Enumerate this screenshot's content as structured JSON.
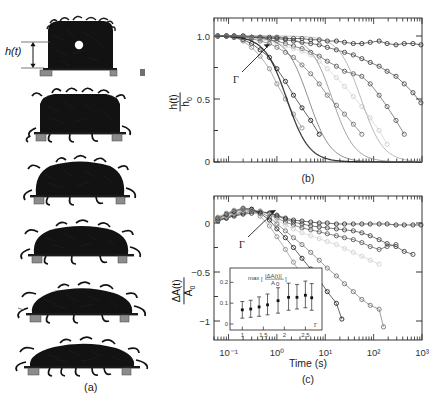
{
  "figure": {
    "panels": [
      {
        "tag": "(a)",
        "kind": "photo-series",
        "caption_label": "(a)"
      },
      {
        "tag": "(b)",
        "kind": "plot",
        "caption_label": "(b)"
      },
      {
        "tag": "(c)",
        "kind": "plot",
        "caption_label": "(c)"
      }
    ]
  },
  "panel_a": {
    "label": "(a)",
    "height_annotation": "h(t)",
    "frame_count": 6,
    "description_alt": "time series photographs of an ant aggregate spreading and flattening on a plate"
  },
  "axis_labels": {
    "y_b_num": "h(t)",
    "y_b_den": "h",
    "y_b_den_sub": "0",
    "y_c_num": "ΔA(t)",
    "y_c_den": "A",
    "y_c_den_sub": "0",
    "x_time": "Time (s)",
    "gamma": "Γ"
  },
  "chart_data": [
    {
      "type": "line",
      "panel": "(b)",
      "title": "",
      "xlabel": "Time (s)",
      "ylabel": "h(t)/h0",
      "xscale": "log",
      "xlim": [
        0.05,
        1000
      ],
      "ylim": [
        0,
        1.12
      ],
      "yticks": [
        0,
        0.5,
        1.0
      ],
      "ytick_labels": [
        "0",
        "0.5",
        "1.0"
      ],
      "xticks": [
        0.1,
        1,
        10,
        100,
        1000
      ],
      "xtick_labels": [
        "",
        "",
        "",
        "",
        ""
      ],
      "grid": false,
      "legend": "none",
      "annotations": [
        {
          "text": "Γ",
          "x": 0.45,
          "y": 0.62,
          "arrow_to_x": 2.2,
          "arrow_to_y": 0.99
        }
      ],
      "series": [
        {
          "name": "G1",
          "shade": "#2b2b2b",
          "marker": "open-circle",
          "x": [
            0.06,
            0.09,
            0.13,
            0.2,
            0.3,
            0.45,
            0.7,
            1.0,
            1.5,
            2.2,
            3.3,
            5,
            7.5,
            11,
            17,
            25,
            38,
            57,
            85,
            130,
            190,
            290,
            430,
            650,
            950
          ],
          "y": [
            1.0,
            1.0,
            1.0,
            1.0,
            0.99,
            0.99,
            0.99,
            0.99,
            0.98,
            0.98,
            0.98,
            0.97,
            0.97,
            0.96,
            0.96,
            0.95,
            0.94,
            0.94,
            0.95,
            0.96,
            0.94,
            0.93,
            0.94,
            0.94,
            0.93
          ]
        },
        {
          "name": "G2",
          "shade": "#3d3d3d",
          "marker": "open-circle",
          "x": [
            0.06,
            0.09,
            0.13,
            0.2,
            0.3,
            0.45,
            0.7,
            1.0,
            1.5,
            2.2,
            3.3,
            5,
            7.5,
            11,
            17,
            25,
            38,
            57,
            85,
            130,
            190,
            290,
            430,
            650,
            950
          ],
          "y": [
            1.0,
            1.0,
            1.0,
            1.0,
            0.99,
            0.99,
            0.98,
            0.98,
            0.97,
            0.96,
            0.95,
            0.94,
            0.93,
            0.91,
            0.89,
            0.87,
            0.85,
            0.82,
            0.79,
            0.76,
            0.72,
            0.68,
            0.62,
            0.55,
            0.47
          ]
        },
        {
          "name": "G3",
          "shade": "#555555",
          "marker": "open-circle",
          "x": [
            0.06,
            0.09,
            0.13,
            0.2,
            0.3,
            0.45,
            0.7,
            1.0,
            1.5,
            2.2,
            3.3,
            5,
            7.5,
            11,
            17,
            25,
            38,
            57,
            85,
            130,
            190,
            290,
            430
          ],
          "y": [
            1.0,
            1.0,
            1.0,
            0.99,
            0.99,
            0.98,
            0.97,
            0.96,
            0.94,
            0.92,
            0.9,
            0.87,
            0.84,
            0.8,
            0.76,
            0.72,
            0.7,
            0.68,
            0.62,
            0.53,
            0.44,
            0.33,
            0.22
          ]
        },
        {
          "name": "G4",
          "shade": "#cfcfcf",
          "marker": "open-circle",
          "x": [
            0.06,
            0.09,
            0.13,
            0.2,
            0.3,
            0.45,
            0.7,
            1.0,
            1.5,
            2.2,
            3.3,
            5,
            7.5,
            11,
            17,
            25,
            38,
            57,
            85,
            130,
            190
          ],
          "y": [
            1.0,
            1.0,
            0.99,
            0.99,
            0.98,
            0.97,
            0.96,
            0.94,
            0.92,
            0.9,
            0.88,
            0.85,
            0.8,
            0.74,
            0.67,
            0.6,
            0.52,
            0.44,
            0.35,
            0.25,
            0.14
          ]
        },
        {
          "name": "G5",
          "shade": "#6e6e6e",
          "marker": "open-circle",
          "x": [
            0.06,
            0.09,
            0.13,
            0.2,
            0.3,
            0.45,
            0.7,
            1.0,
            1.5,
            2.2,
            3.3,
            5,
            7.5,
            11,
            17,
            25,
            38,
            57
          ],
          "y": [
            1.0,
            1.0,
            0.99,
            0.99,
            0.98,
            0.96,
            0.94,
            0.91,
            0.87,
            0.83,
            0.77,
            0.7,
            0.62,
            0.53,
            0.45,
            0.38,
            0.3,
            0.22
          ]
        },
        {
          "name": "G6",
          "shade": "#1a1a1a",
          "marker": "open-circle",
          "x": [
            0.06,
            0.09,
            0.13,
            0.2,
            0.3,
            0.45,
            0.7,
            1.0,
            1.5,
            2.2,
            3.3,
            5,
            7.5
          ],
          "y": [
            1.0,
            1.0,
            0.99,
            0.97,
            0.94,
            0.89,
            0.83,
            0.74,
            0.64,
            0.53,
            0.43,
            0.33,
            0.22
          ]
        },
        {
          "name": "G7",
          "shade": "#8a8a8a",
          "marker": "open-circle",
          "x": [
            0.06,
            0.09,
            0.13,
            0.2,
            0.3,
            0.45,
            0.7,
            1.0,
            1.5,
            2.2,
            3.3
          ],
          "y": [
            1.0,
            1.0,
            0.99,
            0.96,
            0.91,
            0.84,
            0.74,
            0.62,
            0.5,
            0.38,
            0.27
          ]
        }
      ],
      "fit_curves": [
        {
          "name": "fit1",
          "shade": "#1a1a1a"
        },
        {
          "name": "fit2",
          "shade": "#444444"
        },
        {
          "name": "fit3",
          "shade": "#666666"
        },
        {
          "name": "fit4",
          "shade": "#888888"
        }
      ]
    },
    {
      "type": "line",
      "panel": "(c)",
      "title": "",
      "xlabel": "Time (s)",
      "ylabel": "ΔA(t)/A0",
      "xscale": "log",
      "xlim": [
        0.05,
        1000
      ],
      "ylim": [
        -1.18,
        0.28
      ],
      "yticks": [
        0,
        -0.5,
        -1
      ],
      "ytick_labels": [
        "0",
        "−0.5",
        "−1"
      ],
      "xticks": [
        0.1,
        1,
        10,
        100,
        1000
      ],
      "xtick_labels": [
        "10⁻¹",
        "10⁰",
        "10¹",
        "10²",
        "10³"
      ],
      "grid": false,
      "legend": "none",
      "annotations": [
        {
          "text": "Γ",
          "x": 0.4,
          "y": -0.24,
          "arrow_to_x": 2.0,
          "arrow_to_y": 0.14
        }
      ],
      "series": [
        {
          "name": "G1",
          "shade": "#2b2b2b",
          "marker": "open-circle",
          "x": [
            0.06,
            0.09,
            0.13,
            0.2,
            0.3,
            0.45,
            0.7,
            1.0,
            1.5,
            2.2,
            3.3,
            5,
            7.5,
            11,
            17,
            25,
            38,
            57,
            85,
            130,
            190,
            290,
            430,
            650,
            950
          ],
          "y": [
            0.03,
            0.05,
            0.07,
            0.09,
            0.1,
            0.11,
            0.1,
            0.08,
            0.05,
            0.03,
            0.02,
            0.01,
            0.0,
            0.0,
            -0.01,
            -0.01,
            -0.01,
            -0.01,
            -0.01,
            -0.01,
            -0.01,
            -0.02,
            -0.02,
            -0.02,
            -0.02
          ]
        },
        {
          "name": "G2",
          "shade": "#3d3d3d",
          "marker": "open-circle",
          "x": [
            0.06,
            0.09,
            0.13,
            0.2,
            0.3,
            0.45,
            0.7,
            1.0,
            1.5,
            2.2,
            3.3,
            5,
            7.5,
            11,
            17,
            25,
            38,
            57,
            85,
            130,
            190,
            290,
            430,
            650
          ],
          "y": [
            0.02,
            0.05,
            0.08,
            0.1,
            0.12,
            0.12,
            0.1,
            0.07,
            0.04,
            0.01,
            -0.01,
            -0.03,
            -0.04,
            -0.05,
            -0.06,
            -0.07,
            -0.08,
            -0.1,
            -0.13,
            -0.17,
            -0.21,
            -0.24,
            -0.29,
            -0.32
          ]
        },
        {
          "name": "G3",
          "shade": "#555555",
          "marker": "open-circle",
          "x": [
            0.06,
            0.09,
            0.13,
            0.2,
            0.3,
            0.45,
            0.7,
            1.0,
            1.5,
            2.2,
            3.3,
            5,
            7.5,
            11,
            17,
            25,
            38,
            57,
            85,
            130,
            190,
            290
          ],
          "y": [
            0.03,
            0.06,
            0.09,
            0.12,
            0.13,
            0.12,
            0.09,
            0.05,
            0.01,
            -0.02,
            -0.05,
            -0.07,
            -0.09,
            -0.11,
            -0.13,
            -0.15,
            -0.17,
            -0.2,
            -0.24,
            -0.27,
            -0.24,
            -0.22
          ]
        },
        {
          "name": "G4",
          "shade": "#cfcfcf",
          "marker": "open-circle",
          "x": [
            0.06,
            0.09,
            0.13,
            0.2,
            0.3,
            0.45,
            0.7,
            1.0,
            1.5,
            2.2,
            3.3,
            5,
            7.5,
            11,
            17,
            25,
            38,
            57,
            85,
            130
          ],
          "y": [
            0.04,
            0.07,
            0.1,
            0.13,
            0.14,
            0.12,
            0.08,
            0.03,
            -0.02,
            -0.06,
            -0.1,
            -0.13,
            -0.16,
            -0.19,
            -0.22,
            -0.26,
            -0.3,
            -0.34,
            -0.38,
            -0.42
          ]
        },
        {
          "name": "G5",
          "shade": "#6e6e6e",
          "marker": "open-circle",
          "x": [
            0.06,
            0.09,
            0.13,
            0.2,
            0.3,
            0.45,
            0.7,
            1.0,
            1.5,
            2.2,
            3.3,
            5,
            7.5,
            11,
            17,
            25,
            38,
            57,
            85,
            130,
            160
          ],
          "y": [
            0.04,
            0.08,
            0.11,
            0.14,
            0.14,
            0.11,
            0.06,
            -0.01,
            -0.08,
            -0.15,
            -0.22,
            -0.3,
            -0.38,
            -0.46,
            -0.54,
            -0.62,
            -0.7,
            -0.78,
            -0.84,
            -0.88,
            -1.06
          ]
        },
        {
          "name": "G6",
          "shade": "#1a1a1a",
          "marker": "open-circle",
          "x": [
            0.06,
            0.09,
            0.13,
            0.2,
            0.3,
            0.45,
            0.7,
            1.0,
            1.5,
            2.2,
            3.3,
            5,
            7.5,
            11,
            17,
            22
          ],
          "y": [
            0.05,
            0.09,
            0.12,
            0.15,
            0.14,
            0.1,
            0.03,
            -0.06,
            -0.15,
            -0.25,
            -0.36,
            -0.47,
            -0.58,
            -0.7,
            -0.82,
            -0.98
          ]
        },
        {
          "name": "G7",
          "shade": "#8a8a8a",
          "marker": "open-circle",
          "x": [
            0.06,
            0.09,
            0.13,
            0.2,
            0.3,
            0.45,
            0.7,
            1.0,
            1.5,
            2.2,
            3.3,
            4.5
          ],
          "y": [
            0.06,
            0.1,
            0.13,
            0.15,
            0.13,
            0.07,
            -0.03,
            -0.14,
            -0.27,
            -0.4,
            -0.54,
            -0.64
          ]
        }
      ]
    },
    {
      "type": "scatter",
      "panel": "(c)-inset",
      "title": "",
      "ylabel": "max[|ΔA(t)|/A0]",
      "xlabel": "Γ",
      "xscale": "linear",
      "xlim": [
        0.85,
        2.8
      ],
      "ylim": [
        0,
        0.24
      ],
      "yticks": [
        0,
        0.1,
        0.2
      ],
      "ytick_labels": [
        "0",
        "0.1",
        "0.2"
      ],
      "xticks": [
        1,
        1.5,
        2,
        2.5
      ],
      "xtick_labels": [
        "1",
        "1.5",
        "2",
        "2.5"
      ],
      "grid": false,
      "legend": "none",
      "x": [
        1.0,
        1.2,
        1.4,
        1.6,
        1.85,
        2.1,
        2.3,
        2.5,
        2.65
      ],
      "values": [
        0.068,
        0.072,
        0.082,
        0.092,
        0.112,
        0.128,
        0.128,
        0.138,
        0.126
      ],
      "yerr_low": [
        0.04,
        0.04,
        0.045,
        0.048,
        0.06,
        0.062,
        0.056,
        0.06,
        0.06
      ],
      "yerr_high": [
        0.04,
        0.042,
        0.048,
        0.052,
        0.062,
        0.068,
        0.062,
        0.068,
        0.068
      ]
    }
  ]
}
